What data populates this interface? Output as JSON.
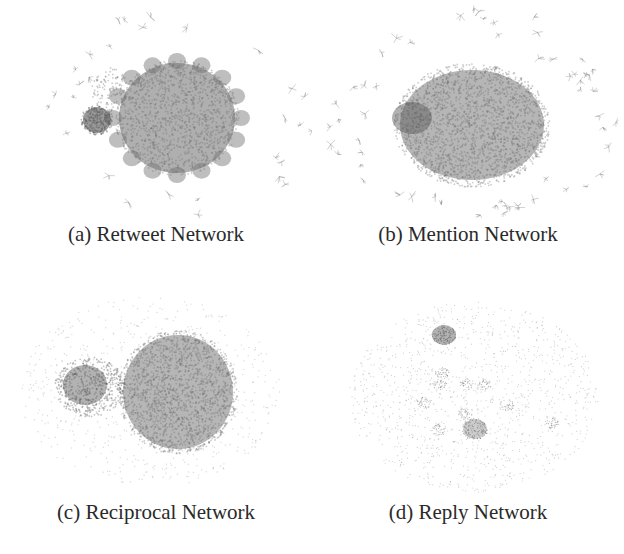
{
  "figure": {
    "panels": [
      {
        "label": "(a)",
        "caption": "(a) Retweet Network",
        "type": "retweet"
      },
      {
        "label": "(b)",
        "caption": "(b) Mention Network",
        "type": "mention"
      },
      {
        "label": "(c)",
        "caption": "(c) Reciprocal Network",
        "type": "reciprocal"
      },
      {
        "label": "(d)",
        "caption": "(d) Reply Network",
        "type": "reply"
      }
    ]
  },
  "colors": {
    "node": "#6e6e6e",
    "dense": "#555555",
    "background": "#ffffff"
  }
}
